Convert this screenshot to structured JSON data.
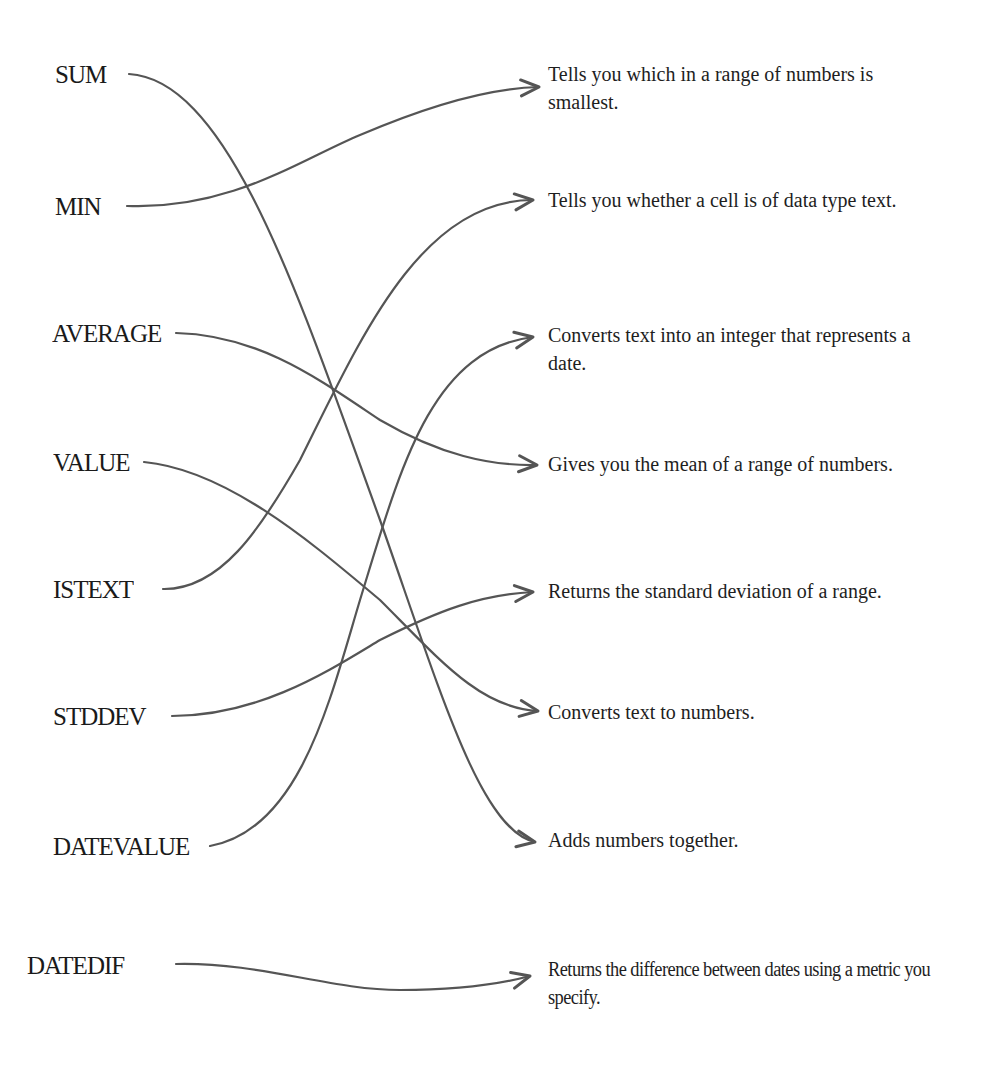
{
  "colors": {
    "background": "#ffffff",
    "text": "#1a1a1a",
    "line": "#555555"
  },
  "functions": [
    {
      "label": "SUM",
      "x": 55,
      "y": 60
    },
    {
      "label": "MIN",
      "x": 55,
      "y": 192
    },
    {
      "label": "AVERAGE",
      "x": 52,
      "y": 319
    },
    {
      "label": "VALUE",
      "x": 53,
      "y": 448
    },
    {
      "label": "ISTEXT",
      "x": 53,
      "y": 575
    },
    {
      "label": "STDDEV",
      "x": 53,
      "y": 702
    },
    {
      "label": "DATEVALUE",
      "x": 53,
      "y": 832
    },
    {
      "label": "DATEDIF",
      "x": 27,
      "y": 951
    }
  ],
  "descriptions": [
    {
      "text": "Tells you which in a range of numbers is smallest.",
      "y": 60
    },
    {
      "text": "Tells you whether a cell is of data type text.",
      "y": 186
    },
    {
      "text": "Converts text into an integer that represents a date.",
      "y": 321
    },
    {
      "text": "Gives you the mean of a range of numbers.",
      "y": 450
    },
    {
      "text": "Returns the standard deviation of a range.",
      "y": 577
    },
    {
      "text": "Converts text to numbers.",
      "y": 698
    },
    {
      "text": "Adds numbers together.",
      "y": 826
    },
    {
      "text": "Returns the difference between dates using a metric you specify.",
      "y": 955
    }
  ],
  "connections": [
    {
      "from": "SUM",
      "to": "Adds numbers together.",
      "path": "M129,74 C230,80 300,300 380,520 C440,690 480,830 535,842",
      "tip": [
        535,
        842
      ],
      "angle": 10
    },
    {
      "from": "MIN",
      "to": "Tells you which in a range of numbers is smallest.",
      "path": "M127,206 C230,210 300,160 360,135 C430,105 490,88 539,87",
      "tip": [
        539,
        87
      ],
      "angle": -3
    },
    {
      "from": "AVERAGE",
      "to": "Gives you the mean of a range of numbers.",
      "path": "M176,333 C260,335 320,380 380,420 C440,455 490,466 537,465",
      "tip": [
        537,
        465
      ],
      "angle": 4
    },
    {
      "from": "VALUE",
      "to": "Converts text to numbers.",
      "path": "M144,462 C230,470 320,550 380,600 C440,660 480,708 538,711",
      "tip": [
        538,
        711
      ],
      "angle": 8
    },
    {
      "from": "ISTEXT",
      "to": "Tells you whether a cell is of data type text.",
      "path": "M163,589 C220,590 260,530 300,460 C360,340 420,200 533,200",
      "tip": [
        533,
        200
      ],
      "angle": -6
    },
    {
      "from": "STDDEV",
      "to": "Returns the standard deviation of a range.",
      "path": "M172,716 C260,716 330,670 380,640 C440,610 480,595 533,592",
      "tip": [
        533,
        592
      ],
      "angle": -5
    },
    {
      "from": "DATEVALUE",
      "to": "Converts text into an integer that represents a date.",
      "path": "M210,846 C300,830 330,700 360,600 C400,470 430,350 533,337",
      "tip": [
        533,
        337
      ],
      "angle": -10
    },
    {
      "from": "DATEDIF",
      "to": "Returns the difference between dates using a metric you specify.",
      "path": "M176,964 C260,962 330,990 400,990 C460,990 500,984 530,976",
      "tip": [
        530,
        976
      ],
      "angle": -14
    }
  ]
}
